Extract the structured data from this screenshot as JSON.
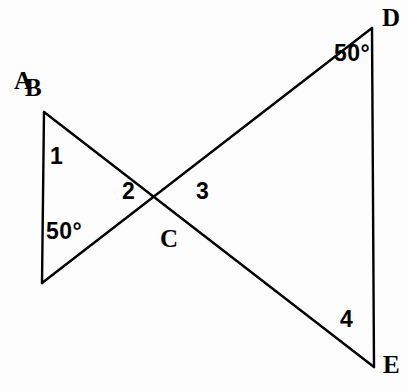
{
  "figure": {
    "type": "geometry-diagram",
    "background_color": "#fdfdfd",
    "stroke_color": "#000000",
    "stroke_width": 2.4,
    "canvas": {
      "width": 409,
      "height": 391
    }
  },
  "points": [
    {
      "id": "A",
      "label": "A",
      "x": 43,
      "y": 283,
      "label_x": 14,
      "label_y": 268
    },
    {
      "id": "B",
      "label": "B",
      "x": 44,
      "y": 112,
      "label_x": 25,
      "label_y": 75
    },
    {
      "id": "C",
      "label": "C",
      "x": 169,
      "y": 195,
      "label_x": 160,
      "label_y": 226
    },
    {
      "id": "D",
      "label": "D",
      "x": 372,
      "y": 28,
      "label_x": 382,
      "label_y": 5
    },
    {
      "id": "E",
      "label": "E",
      "x": 374,
      "y": 367,
      "label_x": 383,
      "label_y": 352
    }
  ],
  "segments": [
    {
      "id": "AB",
      "from": "A",
      "to": "B",
      "name": "segment-ab"
    },
    {
      "id": "BE",
      "from": "B",
      "to": "E",
      "name": "segment-be"
    },
    {
      "id": "AD",
      "from": "A",
      "to": "D",
      "name": "segment-ad"
    },
    {
      "id": "DE",
      "from": "D",
      "to": "E",
      "name": "segment-de"
    }
  ],
  "angle_labels": [
    {
      "id": "angle-1",
      "text": "1",
      "x": 50,
      "y": 145,
      "kind": "number",
      "at_vertex": "B"
    },
    {
      "id": "angle-2",
      "text": "2",
      "x": 122,
      "y": 180,
      "kind": "number",
      "at_vertex": "C"
    },
    {
      "id": "angle-3",
      "text": "3",
      "x": 196,
      "y": 180,
      "kind": "number",
      "at_vertex": "C"
    },
    {
      "id": "angle-4",
      "text": "4",
      "x": 340,
      "y": 308,
      "kind": "number",
      "at_vertex": "E"
    },
    {
      "id": "angle-a",
      "text": "50°",
      "x": 46,
      "y": 220,
      "kind": "measure",
      "at_vertex": "A"
    },
    {
      "id": "angle-d",
      "text": "50°",
      "x": 334,
      "y": 42,
      "kind": "measure",
      "at_vertex": "D"
    }
  ]
}
